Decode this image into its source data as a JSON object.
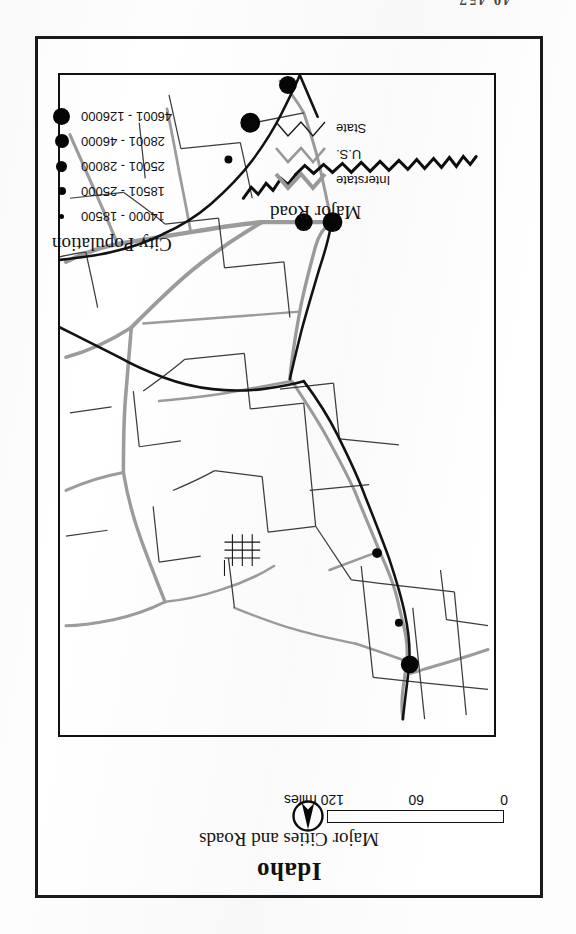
{
  "page": {
    "top_fragment": "40 457",
    "background_color": "#ffffff",
    "border_color": "#1a1a1a"
  },
  "title": {
    "main": "Idaho",
    "subtitle": "Major Cities and Roads"
  },
  "scale": {
    "labels": [
      "0",
      "60",
      "120 miles"
    ],
    "min": 0,
    "mid": 60,
    "max": 120,
    "units": "miles",
    "filled_color": "#8c8c8c",
    "empty_color": "#ffffff"
  },
  "north_arrow": {
    "label": "N",
    "needle_color": "#050505"
  },
  "legend_roads": {
    "title": "Major Road",
    "items": [
      {
        "label": "Interstate",
        "color": "#999999",
        "width": 4
      },
      {
        "label": "U.S.",
        "color": "#999999",
        "width": 2.6
      },
      {
        "label": "State",
        "color": "#1a1a1a",
        "width": 1.4
      }
    ]
  },
  "legend_cities": {
    "title": "City Population",
    "items": [
      {
        "label": "14000 - 18500",
        "size": 5,
        "min": 14000,
        "max": 18500
      },
      {
        "label": "18501 - 25000",
        "size": 8,
        "min": 18501,
        "max": 25000
      },
      {
        "label": "25001 - 28000",
        "size": 11,
        "min": 25001,
        "max": 28000
      },
      {
        "label": "28001 - 46000",
        "size": 14,
        "min": 28001,
        "max": 46000
      },
      {
        "label": "46001 - 126000",
        "size": 17,
        "min": 46001,
        "max": 126000
      }
    ],
    "dot_color": "#050505"
  },
  "map": {
    "state": "Idaho",
    "outline_color": "#141414",
    "county_line_color": "#3a3a3a",
    "highway_color": "#9a9a9a",
    "cities": [
      {
        "name": "city-dot-1",
        "cx": 163,
        "cy": 516,
        "r": 10
      },
      {
        "name": "city-dot-2",
        "cx": 192,
        "cy": 516,
        "r": 9
      },
      {
        "name": "city-dot-3",
        "cx": 268,
        "cy": 579,
        "r": 4
      },
      {
        "name": "city-dot-4",
        "cx": 246,
        "cy": 616,
        "r": 10
      },
      {
        "name": "city-dot-5",
        "cx": 208,
        "cy": 654,
        "r": 9
      },
      {
        "name": "city-dot-6",
        "cx": 118,
        "cy": 183,
        "r": 5
      },
      {
        "name": "city-dot-7",
        "cx": 96,
        "cy": 113,
        "r": 4
      },
      {
        "name": "city-dot-8",
        "cx": 85,
        "cy": 71,
        "r": 9
      }
    ]
  }
}
